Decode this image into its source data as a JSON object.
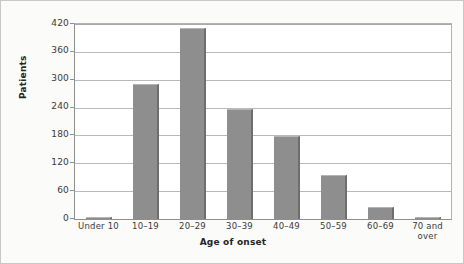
{
  "chart_data": {
    "type": "bar",
    "title": "",
    "xlabel": "Age of onset",
    "ylabel": "Patients",
    "categories": [
      "Under 10",
      "10–19",
      "20–29",
      "30–39",
      "40–49",
      "50–59",
      "60–69",
      "70 and over"
    ],
    "category_lines": [
      [
        "Under 10"
      ],
      [
        "10–19"
      ],
      [
        "20–29"
      ],
      [
        "30–39"
      ],
      [
        "40–49"
      ],
      [
        "50–59"
      ],
      [
        "60–69"
      ],
      [
        "70 and",
        "over"
      ]
    ],
    "values": [
      3,
      291,
      412,
      236,
      179,
      95,
      26,
      4
    ],
    "ylim": [
      0,
      420
    ],
    "yticks": [
      0,
      60,
      120,
      180,
      240,
      300,
      360,
      420
    ],
    "ytick_labels": [
      "0",
      "60",
      "120",
      "180",
      "240",
      "300",
      "360",
      "420"
    ],
    "grid": true,
    "legend": "none",
    "bar_color": "#8e8e8e",
    "bar_edge_color": "#6e6e6e",
    "gridline_color": "#b9b9b9",
    "axis_color": "#8f8f8f",
    "plot_background": "#ffffff",
    "figure_background": "#fbfbf9"
  }
}
